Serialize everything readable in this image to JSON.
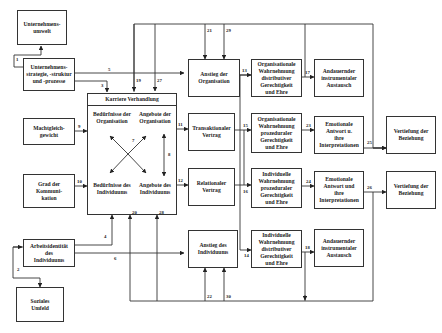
{
  "boxes": {
    "unternehmensumwelt": "Unternehmens-\numwelt",
    "unternehmensstrategie": "Unternehmens-\nstrategie, -struktur\nund -prozesse",
    "machtgleichgewicht": "Machtgleich-\ngewicht",
    "grad_kommunikation": "Grad der\nKommuni-\nkation",
    "arbeitsidentitaet": "Arbeitsidentität\ndes\nIndividuums",
    "soziales_umfeld": "Soziales\nUmfeld",
    "anstieg_organisation": "Anstieg der\nOrganisation",
    "transaktionaler_vertrag": "Transaktionaler\nVertrag",
    "relationaler_vertrag": "Relationaler\nVertrag",
    "anstieg_individuum": "Anstieg des\nIndividuums",
    "org_wahrn_distributiv": "Organisationale\nWahrnehmung\ndistributiver\nGerechtigkeit\nund Ehre",
    "org_wahrn_prozedural": "Organisationale\nWahrnehmung\nprozeduraler\nGerechtigkeit\nund Ehre",
    "ind_wahrn_prozedural": "Individuelle\nWahrnehmung\nprozeduraler\nGerechtigkeit\nund Ehre",
    "ind_wahrn_distributiv": "Individuelle\nWahrnehmung\ndistributiver\nGerechtigkeit\nund Ehre",
    "austausch_1": "Andauernder\ninstrumentaler\nAustausch",
    "emotionale_1": "Emotionale\nAntwort u.\nihre\nInterpretationen",
    "emotionale_2": "Emotionale\nAntwort und\nihre\nInterpretationen",
    "austausch_2": "Andauernder\ninstrumentaler\nAustausch",
    "vertiefung_1": "Vertiefung der\nBeziehung",
    "vertiefung_2": "Vertiefung der\nBeziehung"
  },
  "karriere": {
    "title": "Karriere Verhandlung",
    "tl": "Bedürfnisse der\nOrganisation",
    "tr": "Angebote der\nOrganisation",
    "bl": "Bedürfnisse des\nIndividuums",
    "br": "Angebote des\nIndividuums",
    "arrow7": "7",
    "arrow8": "8"
  },
  "labels": {
    "l1": "1",
    "l2": "2",
    "l3": "3",
    "l4": "4",
    "l5": "5",
    "l6": "6",
    "l9": "9",
    "l10": "10",
    "l11": "11",
    "l12": "12",
    "l13": "13",
    "l14": "14",
    "l15": "15",
    "l16": "16",
    "l17": "17",
    "l18": "18",
    "l19": "19",
    "l20": "20",
    "l21": "21",
    "l22": "22",
    "l23": "23",
    "l24": "24",
    "l25": "25",
    "l26": "26",
    "l27": "27",
    "l28": "28",
    "l29": "29",
    "l30": "30"
  }
}
